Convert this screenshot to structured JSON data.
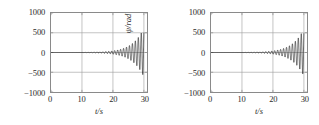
{
  "figure": {
    "background_color": "#ffffff",
    "axis_color": "#8a8a8a",
    "grid_color": "#9a9a9a",
    "line_color": "#000000"
  },
  "chart_data": [
    {
      "type": "line",
      "panel": "left",
      "title": "",
      "xlabel": "t/s",
      "ylabel": "θ/rad",
      "xlim": [
        0,
        31
      ],
      "ylim": [
        -1000,
        1000
      ],
      "xticks": [
        0,
        10,
        20,
        30
      ],
      "xtick_labels": [
        "0",
        "10",
        "20",
        "30"
      ],
      "yticks": [
        1000,
        500,
        0,
        -500,
        -1000
      ],
      "ytick_labels": [
        "1000",
        "500",
        "0",
        "−500",
        "−1000"
      ],
      "grid": true,
      "legend": null,
      "series": [
        {
          "name": "θ",
          "description": "Exponentially growing oscillation, flat near zero from t=0 to t≈7 s, then increasing amplitude, reaching about ±600 rad near t=30 s",
          "onset_time": 7.0,
          "growth_rate": 0.27,
          "frequency_hz": 1.05,
          "amplitude_at_end": 620,
          "min_value": -650,
          "max_value": 600
        }
      ]
    },
    {
      "type": "line",
      "panel": "right",
      "title": "",
      "xlabel": "t/s",
      "ylabel": "ψ/rad",
      "xlim": [
        0,
        31
      ],
      "ylim": [
        -1000,
        1000
      ],
      "xticks": [
        0,
        10,
        20,
        30
      ],
      "xtick_labels": [
        "0",
        "10",
        "20",
        "30"
      ],
      "yticks": [
        1000,
        500,
        0,
        -500,
        -1000
      ],
      "ytick_labels": [
        "1000",
        "500",
        "0",
        "−500",
        "−1000"
      ],
      "grid": true,
      "legend": null,
      "series": [
        {
          "name": "ψ",
          "description": "Exponentially growing oscillation, flat near zero from t=0 to t≈7 s, then increasing amplitude, reaching about ±600 rad near t=30 s",
          "onset_time": 7.0,
          "growth_rate": 0.27,
          "frequency_hz": 1.05,
          "amplitude_at_end": 600,
          "min_value": -640,
          "max_value": 590
        }
      ]
    }
  ]
}
